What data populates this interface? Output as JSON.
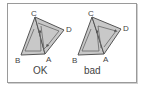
{
  "figure": {
    "colors": {
      "fill": "#c8c8c8",
      "edge": "#555555",
      "inner_contour": "#666666",
      "label": "#444444",
      "frame": "#9a9a9a"
    },
    "panels": [
      {
        "caption": "OK",
        "vertices": {
          "A": "A",
          "B": "B",
          "C": "C",
          "D": "D"
        },
        "winding": "consistent"
      },
      {
        "caption": "bad",
        "vertices": {
          "A": "A",
          "B": "B",
          "C": "C",
          "D": "D"
        },
        "winding": "inconsistent"
      }
    ]
  }
}
